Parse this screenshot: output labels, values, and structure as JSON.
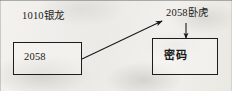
{
  "diagram": {
    "type": "flow-diagram",
    "background_color": "#eeedea",
    "ink_color": "#1a1a1a",
    "labels": [
      {
        "name": "left-top-label",
        "text": "1010银龙"
      },
      {
        "name": "right-top-label",
        "text": "2058卧虎"
      }
    ],
    "boxes": [
      {
        "name": "left-box",
        "text": "2058"
      },
      {
        "name": "right-box",
        "text": "密码"
      }
    ],
    "arrows": [
      {
        "name": "diagonal-arrow",
        "from": "left-box-right-edge",
        "to": "right-top-label",
        "direction": "up-right"
      },
      {
        "name": "vertical-arrow",
        "from": "right-top-label",
        "to": "right-box-top-edge",
        "direction": "down"
      }
    ]
  }
}
